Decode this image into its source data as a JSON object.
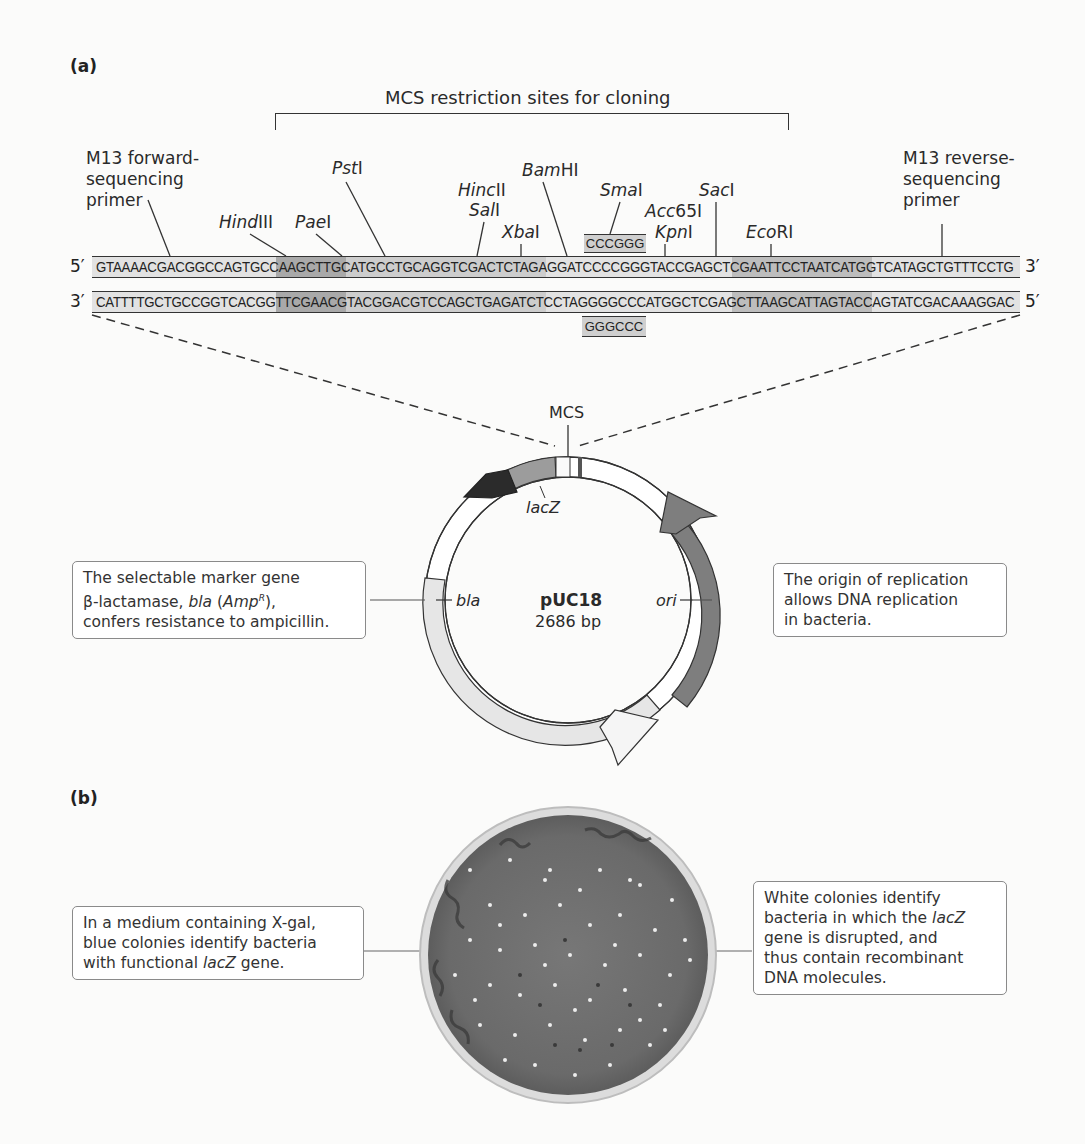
{
  "panels": {
    "a": {
      "label": "(a)",
      "mcs_bracket_label": "MCS restriction sites for cloning",
      "primers": {
        "forward": {
          "lines": [
            "M13 forward-",
            "sequencing",
            "primer"
          ]
        },
        "reverse": {
          "lines": [
            "M13 reverse-",
            "sequencing",
            "primer"
          ]
        }
      },
      "restriction_sites": [
        {
          "italic": "Hind",
          "roman": "III"
        },
        {
          "italic": "Pae",
          "roman": "I"
        },
        {
          "italic": "Pst",
          "roman": "I"
        },
        {
          "italic": "Hinc",
          "roman": "II"
        },
        {
          "italic": "Sal",
          "roman": "I"
        },
        {
          "italic": "Xba",
          "roman": "I"
        },
        {
          "italic": "Bam",
          "roman": "HI"
        },
        {
          "italic": "Sma",
          "roman": "I"
        },
        {
          "italic": "Acc",
          "roman": "65I"
        },
        {
          "italic": "Kpn",
          "roman": "I"
        },
        {
          "italic": "Sac",
          "roman": "I"
        },
        {
          "italic": "Eco",
          "roman": "RI"
        }
      ],
      "sma_site_top": "CCCGGG",
      "sma_site_bottom": "GGGCCC",
      "top_strand": {
        "left_end": "5′",
        "sequence": "GTAAAACGACGGCCAGTGCCAAGCTTGCATGCCTGCAGGTCGACTCTAGAGGATCCCCGGGTACCGAGCTCGAATTCCTAATCATGGTCATAGCTGTTTCCTG",
        "right_end": "3′"
      },
      "bottom_strand": {
        "left_end": "3′",
        "sequence": "CATTTTGCTGCCGGTCACGGTTCGAACGTACGGACGTCCAGCTGAGATCTCCTAGGGGCCCATGGCTCGAGCTTAAGCATTAGTACCAGTATCGACAAAGGAC",
        "right_end": "5′"
      },
      "plasmid": {
        "name": "pUC18",
        "size": "2686 bp",
        "mcs_label": "MCS",
        "genes": {
          "lacZ": "lacZ",
          "bla": "bla",
          "ori": "ori"
        },
        "colors": {
          "lacZ_arrow": "#2b2b2b",
          "lacZ_band": "#9c9c9c",
          "ori": "#7e7e7e",
          "bla": "#e6e6e6",
          "backbone": "#ffffff"
        }
      },
      "callouts": {
        "bla": {
          "line1": "The selectable marker gene",
          "line2_pre": "β-lactamase, ",
          "line2_italic": "bla",
          "line2_mid": " (",
          "line2_amp": "Amp",
          "line2_sup": "R",
          "line2_post": "),",
          "line3": "confers resistance to ampicillin."
        },
        "ori": {
          "lines": [
            "The origin of replication",
            "allows DNA replication",
            "in bacteria."
          ]
        }
      }
    },
    "b": {
      "label": "(b)",
      "callouts": {
        "blue": {
          "line1": "In a medium containing X-gal,",
          "line2": "blue colonies identify bacteria",
          "line3_pre": "with functional ",
          "line3_italic": "lacZ",
          "line3_post": " gene."
        },
        "white": {
          "line1": "White colonies identify",
          "line2_pre": "bacteria in which the ",
          "line2_italic": "lacZ",
          "line3": "gene is disrupted, and",
          "line4": "thus contain recombinant",
          "line5": "DNA molecules."
        }
      },
      "plate_colors": {
        "agar": "#6f6f6f",
        "rim": "#d8d8d8",
        "colony_white": "#eeeeee",
        "colony_blue": "#3a3a3a"
      }
    }
  }
}
